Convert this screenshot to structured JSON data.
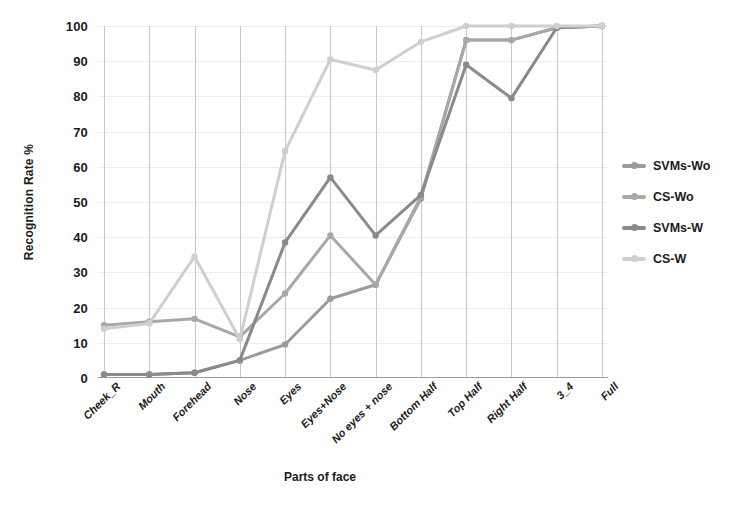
{
  "chart_data": {
    "type": "line",
    "title": "",
    "xlabel": "Parts of face",
    "ylabel": "Recognition Rate %",
    "ylim": [
      0,
      100
    ],
    "yticks": [
      0,
      10,
      20,
      30,
      40,
      50,
      60,
      70,
      80,
      90,
      100
    ],
    "grid": "horizontal-and-vertical",
    "legend_position": "right",
    "categories": [
      "Cheek_R",
      "Mouth",
      "Forehead",
      "Nose",
      "Eyes",
      "Eyes+Nose",
      "No eyes + nose",
      "Bottom Half",
      "Top Half",
      "Right Half",
      "3_4",
      "Full"
    ],
    "series": [
      {
        "name": "SVMs-Wo",
        "color": "#9b9b9b",
        "values": [
          1,
          1,
          1.5,
          5,
          9.5,
          22.5,
          26.5,
          51,
          96,
          96,
          99.5,
          100
        ]
      },
      {
        "name": "CS-Wo",
        "color": "#a8a8a8",
        "values": [
          15,
          16,
          16.8,
          11.7,
          24,
          40.5,
          26.5,
          51.5,
          96,
          96,
          99.5,
          100
        ]
      },
      {
        "name": "SVMs-W",
        "color": "#8a8a8a",
        "values": [
          1,
          1,
          1.5,
          5,
          38.5,
          57,
          40.5,
          52,
          89,
          79.5,
          99.5,
          100
        ]
      },
      {
        "name": "CS-W",
        "color": "#cfcfcf",
        "values": [
          14,
          15.5,
          34.5,
          11,
          64.5,
          90.5,
          87.5,
          95.5,
          100,
          100,
          100,
          100
        ]
      }
    ]
  },
  "axes": {
    "y_title": "Recognition Rate %",
    "x_title": "Parts of face"
  },
  "legend": {
    "items": [
      {
        "label": "SVMs-Wo"
      },
      {
        "label": "CS-Wo"
      },
      {
        "label": "SVMs-W"
      },
      {
        "label": "CS-W"
      }
    ]
  },
  "colors": {
    "grid_horizontal": "#e8eef2",
    "grid_vertical": "#c9c9c9",
    "axis": "#9a9a9a",
    "text": "#1b1b1b",
    "background": "#ffffff"
  }
}
